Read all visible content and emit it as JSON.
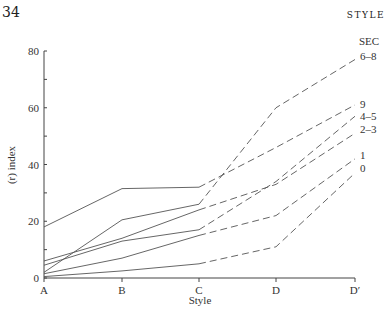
{
  "page_number": "34",
  "running_header": "STYLE",
  "chart_data": {
    "type": "line",
    "title": "",
    "xlabel": "Style",
    "ylabel": "(r) index",
    "categories": [
      "A",
      "B",
      "C",
      "D",
      "D′"
    ],
    "ylim": [
      0,
      80
    ],
    "yticks": [
      0,
      20,
      40,
      60,
      80
    ],
    "legend_title": "SEC",
    "legend_position": "right-end-labels",
    "grid": false,
    "note": "Solid segments A–C, dashed segments C–D′",
    "series": [
      {
        "name": "6–8",
        "values": [
          2,
          20.5,
          26,
          60,
          77
        ]
      },
      {
        "name": "9",
        "values": [
          18,
          31.5,
          32,
          46,
          61
        ]
      },
      {
        "name": "4–5",
        "values": [
          4.5,
          13,
          17,
          34,
          57
        ]
      },
      {
        "name": "2–3",
        "values": [
          6,
          14,
          24,
          33,
          51
        ]
      },
      {
        "name": "1",
        "values": [
          1.5,
          7,
          15,
          22,
          42
        ]
      },
      {
        "name": "0",
        "values": [
          0.5,
          2.5,
          5,
          11,
          37
        ]
      }
    ]
  }
}
